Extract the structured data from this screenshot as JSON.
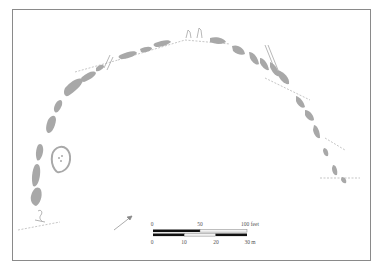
{
  "figure": {
    "type": "archaeological site plan"
  },
  "colors": {
    "stone_fill": "#a8a8a8",
    "frame": "#8a8a8a",
    "line": "#9a9a9a",
    "scale_black": "#111111",
    "scale_white": "#f2f2f2"
  },
  "scale_bar": {
    "feet": {
      "ticks": [
        "0",
        "50",
        "100 feet"
      ]
    },
    "meters": {
      "ticks": [
        "0",
        "10",
        "20",
        "30 m"
      ]
    }
  },
  "north_arrow": {
    "icon": "north-arrow-icon"
  }
}
